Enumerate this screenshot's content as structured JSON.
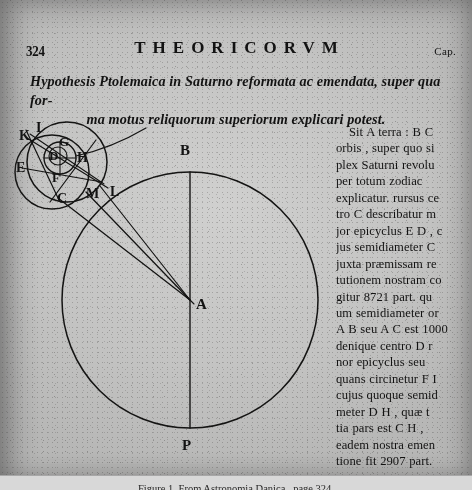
{
  "page": {
    "folio": "324",
    "running_title": "THEORICORVM",
    "chapter_mark": "Cap."
  },
  "heading": {
    "line1": "Hypothesis Ptolemaica in Saturno reformata ac emendata, super qua for-",
    "line2": "ma motus reliquorum superiorum explicari potest."
  },
  "text_column": {
    "lines": [
      "Sit A terra : B C",
      "orbis , super quo si",
      "plex Saturni revolu",
      "per totum zodiac",
      "explicatur. rursus ce",
      "tro C describatur m",
      "jor epicyclus E D , c",
      "jus semidiameter C",
      "juxta præmissam re",
      "tutionem nostram co",
      "gitur 8721 part. qu",
      "um semidiameter or",
      "A B seu A C est 1000",
      "denique centro D r",
      "nor epicyclus seu",
      "quans circinetur F I",
      "cujus quoque semid",
      "meter D H , quæ t",
      "tia pars est C H ,",
      "eadem nostra emen",
      "tione fit 2907 part.",
      "Revolutionum aut"
    ],
    "indented_lines": [
      0,
      21
    ]
  },
  "diagram": {
    "labels": {
      "earth": "A",
      "deferent_top": "B",
      "deferent_bottom": "P",
      "epicycle_center": "C",
      "major_epicycle_d": "D",
      "major_epicycle_e": "E",
      "minor_epicycle_f": "F",
      "minor_epicycle_g": "G",
      "minor_epicycle_h": "H",
      "point_i": "I",
      "point_k": "K",
      "point_l": "L",
      "point_m": "M"
    },
    "values": {
      "deferent_radius_parts": "1000",
      "major_epicycle_semidiameter_parts": "8721",
      "minor_epicycle_semidiameter_parts": "2907"
    }
  },
  "caption": {
    "text": "Figure 1.  From  Astronomia Danica , page 324."
  },
  "colors": {
    "paper": "#c9c7c3",
    "ink": "#15130f"
  }
}
